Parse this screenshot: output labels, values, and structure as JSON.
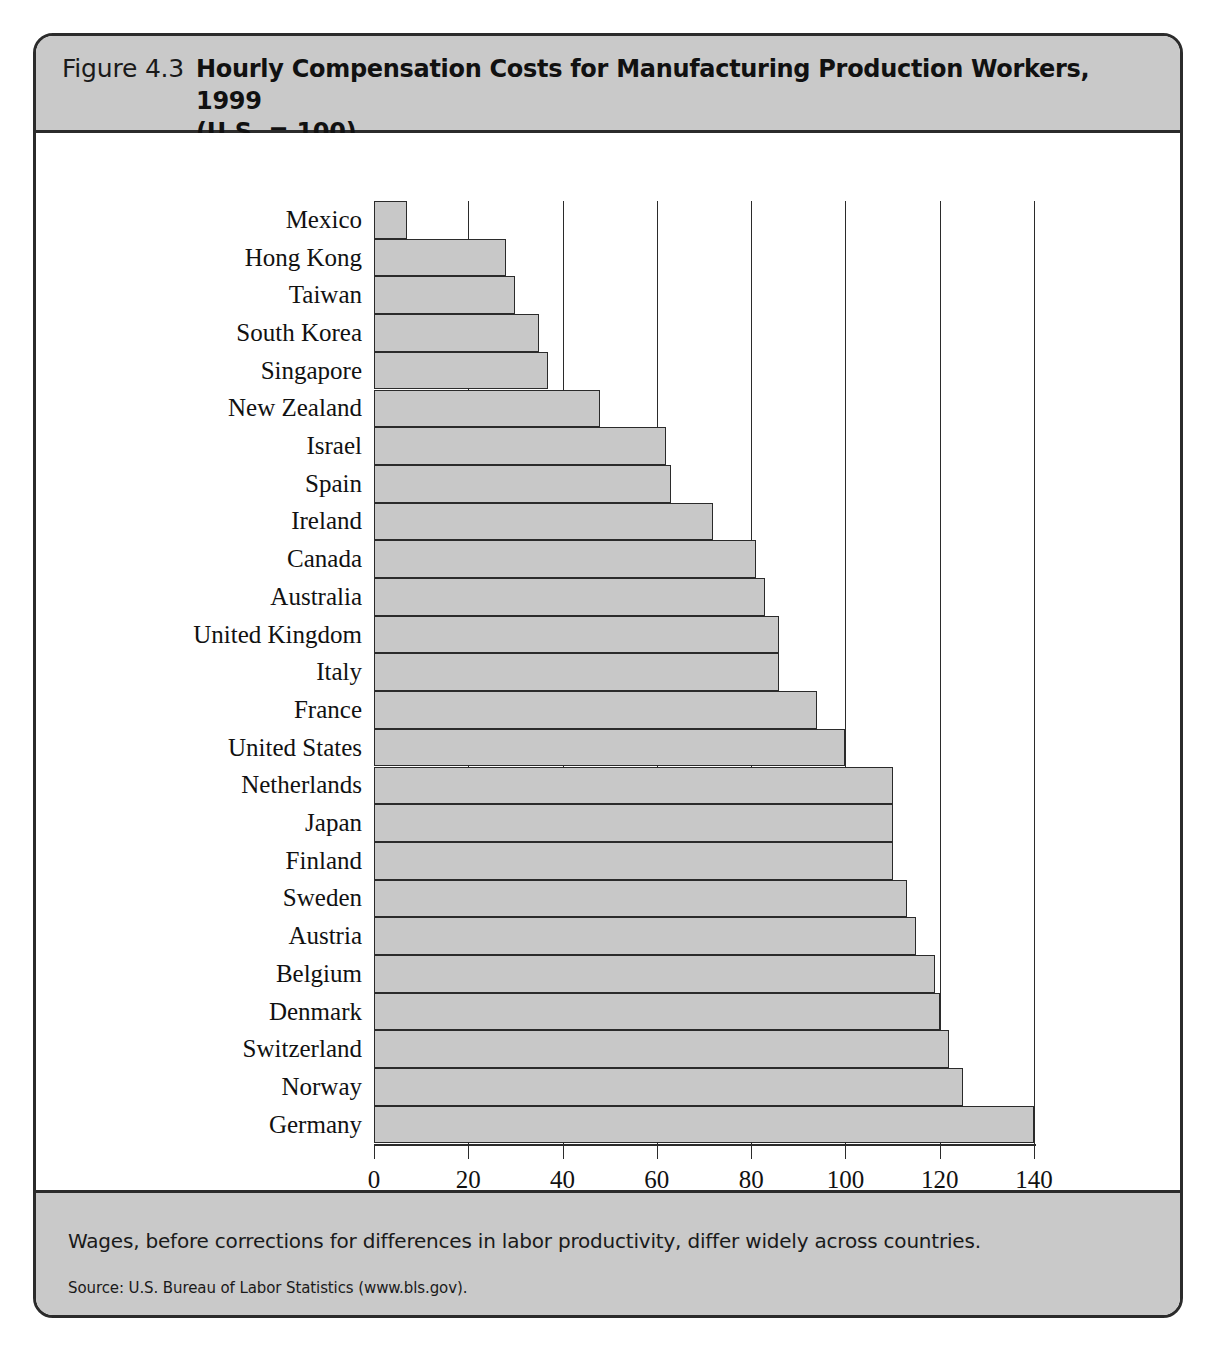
{
  "header": {
    "figure_number": "Figure 4.3",
    "title_line1": "Hourly Compensation Costs for Manufacturing Production Workers, 1999",
    "title_line2": "(U.S.  =  100)"
  },
  "caption": {
    "text": "Wages, before corrections for differences in labor productivity, differ widely across countries.",
    "source": "Source: U.S. Bureau of Labor Statistics (www.bls.gov)."
  },
  "colors": {
    "bar_fill": "#c8c8c8",
    "bar_stroke": "#2b2b2b",
    "band_fill": "#c9c9c9",
    "frame": "#2b2b2b"
  },
  "chart_data": {
    "type": "bar",
    "orientation": "horizontal",
    "title": "Hourly Compensation Costs for Manufacturing Production Workers, 1999 (U.S. = 100)",
    "xlabel": "Index of hourly compensation costs",
    "ylabel": "",
    "xlim": [
      0,
      140
    ],
    "xticks": [
      0,
      20,
      40,
      60,
      80,
      100,
      120,
      140
    ],
    "xtick_labels": [
      "0",
      "20",
      "40",
      "60",
      "80",
      "100",
      "120",
      "140"
    ],
    "grid": "vertical",
    "legend": null,
    "categories": [
      "Mexico",
      "Hong Kong",
      "Taiwan",
      "South Korea",
      "Singapore",
      "New Zealand",
      "Israel",
      "Spain",
      "Ireland",
      "Canada",
      "Australia",
      "United Kingdom",
      "Italy",
      "France",
      "United States",
      "Netherlands",
      "Japan",
      "Finland",
      "Sweden",
      "Austria",
      "Belgium",
      "Denmark",
      "Switzerland",
      "Norway",
      "Germany"
    ],
    "values": [
      7,
      28,
      30,
      35,
      37,
      48,
      62,
      63,
      72,
      81,
      83,
      86,
      86,
      94,
      100,
      110,
      110,
      110,
      113,
      115,
      119,
      120,
      122,
      125,
      140
    ]
  }
}
